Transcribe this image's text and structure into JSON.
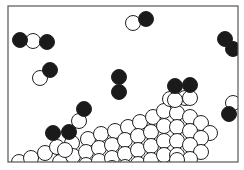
{
  "diagram": {
    "box": {
      "x": 8,
      "y": 6,
      "width": 230,
      "height": 156,
      "stroke": "#555555"
    },
    "colors": {
      "dark_atom": "#1a1a1a",
      "light_atom": "#ffffff",
      "outline": "#222222"
    },
    "atom_radius": 7.5,
    "molecules": [
      {
        "name": "triatomic-molecule-left",
        "atoms": [
          {
            "x": 20,
            "y": 40,
            "type": "dark"
          },
          {
            "x": 33,
            "y": 41,
            "type": "light"
          },
          {
            "x": 47,
            "y": 42,
            "type": "dark"
          }
        ]
      },
      {
        "name": "diatomic-molecule-mid-left",
        "atoms": [
          {
            "x": 40,
            "y": 78,
            "type": "light"
          },
          {
            "x": 50,
            "y": 70,
            "type": "dark"
          }
        ]
      },
      {
        "name": "diatomic-molecule-top-center",
        "atoms": [
          {
            "x": 133,
            "y": 23,
            "type": "light"
          },
          {
            "x": 146,
            "y": 19,
            "type": "dark"
          }
        ]
      },
      {
        "name": "vertical-dark-pair-center",
        "atoms": [
          {
            "x": 119,
            "y": 77,
            "type": "dark"
          },
          {
            "x": 119,
            "y": 92,
            "type": "dark"
          }
        ]
      },
      {
        "name": "dark-pair-top-right",
        "atoms": [
          {
            "x": 225,
            "y": 39,
            "type": "dark"
          },
          {
            "x": 233,
            "y": 49,
            "type": "dark"
          }
        ]
      },
      {
        "name": "molecule-right-center",
        "atoms": [
          {
            "x": 175,
            "y": 86,
            "type": "dark"
          },
          {
            "x": 175,
            "y": 100,
            "type": "light"
          }
        ]
      },
      {
        "name": "molecule-right-center-2",
        "atoms": [
          {
            "x": 190,
            "y": 85,
            "type": "dark"
          },
          {
            "x": 190,
            "y": 98,
            "type": "light"
          }
        ]
      },
      {
        "name": "molecule-far-right",
        "atoms": [
          {
            "x": 233,
            "y": 103,
            "type": "light"
          },
          {
            "x": 229,
            "y": 114,
            "type": "dark"
          }
        ]
      },
      {
        "name": "molecule-left-lower",
        "atoms": [
          {
            "x": 84,
            "y": 109,
            "type": "dark"
          },
          {
            "x": 79,
            "y": 121,
            "type": "light"
          }
        ]
      },
      {
        "name": "dark-pair-lower-left",
        "atoms": [
          {
            "x": 53,
            "y": 133,
            "type": "dark"
          },
          {
            "x": 69,
            "y": 132,
            "type": "dark"
          }
        ]
      }
    ],
    "lattice_atoms": [
      {
        "x": 19,
        "y": 162
      },
      {
        "x": 31,
        "y": 158
      },
      {
        "x": 45,
        "y": 153
      },
      {
        "x": 57,
        "y": 147
      },
      {
        "x": 72,
        "y": 143
      },
      {
        "x": 88,
        "y": 139
      },
      {
        "x": 101,
        "y": 134
      },
      {
        "x": 115,
        "y": 131
      },
      {
        "x": 128,
        "y": 127
      },
      {
        "x": 140,
        "y": 122
      },
      {
        "x": 153,
        "y": 117
      },
      {
        "x": 164,
        "y": 111
      },
      {
        "x": 177,
        "y": 113
      },
      {
        "x": 190,
        "y": 117
      },
      {
        "x": 201,
        "y": 123
      },
      {
        "x": 210,
        "y": 133
      },
      {
        "x": 60,
        "y": 162
      },
      {
        "x": 73,
        "y": 156
      },
      {
        "x": 86,
        "y": 152
      },
      {
        "x": 99,
        "y": 148
      },
      {
        "x": 112,
        "y": 145
      },
      {
        "x": 125,
        "y": 140
      },
      {
        "x": 138,
        "y": 136
      },
      {
        "x": 151,
        "y": 132
      },
      {
        "x": 164,
        "y": 126
      },
      {
        "x": 177,
        "y": 127
      },
      {
        "x": 190,
        "y": 131
      },
      {
        "x": 201,
        "y": 138
      },
      {
        "x": 86,
        "y": 165
      },
      {
        "x": 99,
        "y": 161
      },
      {
        "x": 112,
        "y": 158
      },
      {
        "x": 125,
        "y": 154
      },
      {
        "x": 138,
        "y": 150
      },
      {
        "x": 151,
        "y": 146
      },
      {
        "x": 164,
        "y": 141
      },
      {
        "x": 177,
        "y": 141
      },
      {
        "x": 190,
        "y": 145
      },
      {
        "x": 201,
        "y": 152
      },
      {
        "x": 125,
        "y": 167
      },
      {
        "x": 138,
        "y": 164
      },
      {
        "x": 151,
        "y": 160
      },
      {
        "x": 164,
        "y": 155
      },
      {
        "x": 177,
        "y": 155
      },
      {
        "x": 190,
        "y": 159
      },
      {
        "x": 65,
        "y": 150
      },
      {
        "x": 112,
        "y": 168
      },
      {
        "x": 170,
        "y": 99
      },
      {
        "x": 185,
        "y": 98
      },
      {
        "x": 177,
        "y": 160
      }
    ]
  }
}
